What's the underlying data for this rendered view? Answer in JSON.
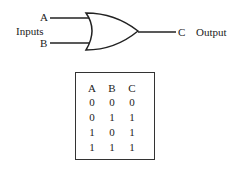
{
  "diagram": {
    "type": "OR gate",
    "inputs": {
      "group_label": "Inputs",
      "a": "A",
      "b": "B"
    },
    "output": {
      "pin": "C",
      "label": "Output"
    }
  },
  "truth_table": {
    "headers": [
      "A",
      "B",
      "C"
    ],
    "rows": [
      [
        "0",
        "0",
        "0"
      ],
      [
        "0",
        "1",
        "1"
      ],
      [
        "1",
        "0",
        "1"
      ],
      [
        "1",
        "1",
        "1"
      ]
    ]
  }
}
